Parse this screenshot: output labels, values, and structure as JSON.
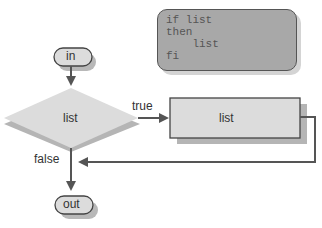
{
  "diagram": {
    "type": "flowchart",
    "code_block": {
      "lines": [
        "if list",
        "then",
        "    list",
        "fi"
      ]
    },
    "nodes": {
      "start": {
        "label": "in",
        "shape": "terminal"
      },
      "condition": {
        "label": "list",
        "shape": "decision"
      },
      "action": {
        "label": "list",
        "shape": "process"
      },
      "end": {
        "label": "out",
        "shape": "terminal"
      }
    },
    "edges": {
      "true_label": "true",
      "false_label": "false"
    },
    "colors": {
      "line": "#555555",
      "node_fill": "#dcdcdc",
      "shadow": "#b5b5b5",
      "code_fill": "#a8a8a8",
      "text": "#333333"
    }
  }
}
